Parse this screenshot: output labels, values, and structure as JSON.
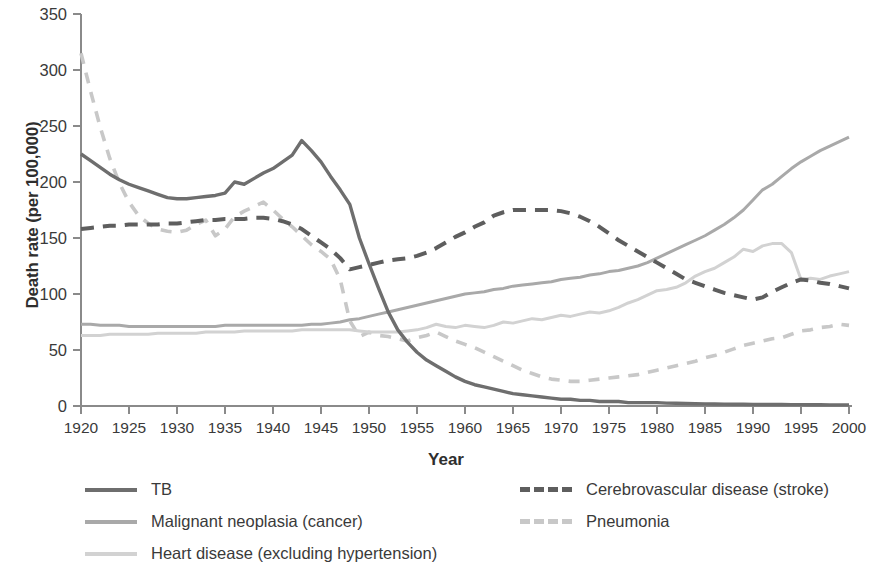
{
  "chart_data": {
    "type": "line",
    "title": "",
    "xlabel": "Year",
    "ylabel": "Death rate (per 100,000)",
    "xlim": [
      1920,
      2000
    ],
    "ylim": [
      0,
      350
    ],
    "ytick_step": 50,
    "xtick_step": 5,
    "grid": false,
    "legend_position": "bottom",
    "xticks": [
      "1920",
      "1925",
      "1930",
      "1935",
      "1940",
      "1945",
      "1950",
      "1955",
      "1960",
      "1965",
      "1970",
      "1975",
      "1980",
      "1985",
      "1990",
      "1995",
      "2000"
    ],
    "yticks": [
      "0",
      "50",
      "100",
      "150",
      "200",
      "250",
      "300",
      "350"
    ],
    "x": [
      1920,
      1921,
      1922,
      1923,
      1924,
      1925,
      1926,
      1927,
      1928,
      1929,
      1930,
      1931,
      1932,
      1933,
      1934,
      1935,
      1936,
      1937,
      1938,
      1939,
      1940,
      1941,
      1942,
      1943,
      1944,
      1945,
      1946,
      1947,
      1948,
      1949,
      1950,
      1951,
      1952,
      1953,
      1954,
      1955,
      1956,
      1957,
      1958,
      1959,
      1960,
      1961,
      1962,
      1963,
      1964,
      1965,
      1966,
      1967,
      1968,
      1969,
      1970,
      1971,
      1972,
      1973,
      1974,
      1975,
      1976,
      1977,
      1978,
      1979,
      1980,
      1981,
      1982,
      1983,
      1984,
      1985,
      1986,
      1987,
      1988,
      1989,
      1990,
      1991,
      1992,
      1993,
      1994,
      1995,
      1996,
      1997,
      1998,
      1999,
      2000
    ],
    "series": [
      {
        "name": "TB",
        "style": "solid",
        "color": "#6e6e6e",
        "width": 3.4,
        "values": [
          225,
          219,
          213,
          207,
          202,
          198,
          195,
          192,
          189,
          186,
          185,
          185,
          186,
          187,
          188,
          190,
          200,
          198,
          203,
          208,
          212,
          218,
          224,
          237,
          228,
          218,
          205,
          193,
          180,
          150,
          127,
          105,
          84,
          68,
          57,
          48,
          41,
          36,
          31,
          26,
          22,
          19,
          17,
          15,
          13,
          11,
          10,
          9,
          8,
          7,
          6,
          6,
          5,
          5,
          4,
          4,
          4,
          3,
          3,
          3,
          3,
          2.6,
          2.4,
          2.2,
          2,
          1.9,
          1.8,
          1.7,
          1.6,
          1.5,
          1.4,
          1.4,
          1.3,
          1.3,
          1.2,
          1.2,
          1.1,
          1.1,
          1,
          1,
          1
        ]
      },
      {
        "name": "Malignant neoplasia (cancer)",
        "style": "solid",
        "color": "#a9a9a9",
        "width": 3.0,
        "values": [
          73,
          73,
          72,
          72,
          72,
          71,
          71,
          71,
          71,
          71,
          71,
          71,
          71,
          71,
          71,
          72,
          72,
          72,
          72,
          72,
          72,
          72,
          72,
          72,
          73,
          73,
          74,
          75,
          77,
          78,
          80,
          82,
          84,
          86,
          88,
          90,
          92,
          94,
          96,
          98,
          100,
          101,
          102,
          104,
          105,
          107,
          108,
          109,
          110,
          111,
          113,
          114,
          115,
          117,
          118,
          120,
          121,
          123,
          125,
          128,
          132,
          136,
          140,
          144,
          148,
          152,
          157,
          162,
          168,
          175,
          184,
          193,
          198,
          205,
          212,
          218,
          223,
          228,
          232,
          236,
          240
        ]
      },
      {
        "name": "Heart disease (excluding hypertension)",
        "style": "solid",
        "color": "#d2d2d2",
        "width": 3.0,
        "values": [
          63,
          63,
          63,
          64,
          64,
          64,
          64,
          64,
          65,
          65,
          65,
          65,
          65,
          66,
          66,
          66,
          66,
          67,
          67,
          67,
          67,
          67,
          67,
          68,
          68,
          68,
          68,
          68,
          68,
          67,
          66,
          66,
          66,
          66,
          67,
          68,
          70,
          73,
          71,
          70,
          72,
          71,
          70,
          72,
          75,
          74,
          76,
          78,
          77,
          79,
          81,
          80,
          82,
          84,
          83,
          85,
          88,
          92,
          95,
          99,
          103,
          104,
          106,
          110,
          116,
          120,
          123,
          128,
          133,
          140,
          138,
          143,
          145,
          145,
          137,
          113,
          114,
          113,
          116,
          118,
          120
        ]
      },
      {
        "name": "Cerebrovascular disease (stroke)",
        "style": "dashed-dark",
        "color": "#5e5e5e",
        "width": 4.0,
        "values": [
          158,
          159,
          160,
          161,
          161,
          162,
          162,
          162,
          162,
          163,
          163,
          164,
          165,
          166,
          166,
          167,
          167,
          167,
          168,
          168,
          167,
          165,
          162,
          158,
          152,
          146,
          140,
          132,
          122,
          124,
          126,
          128,
          130,
          131,
          132,
          134,
          137,
          141,
          146,
          151,
          155,
          160,
          164,
          170,
          173,
          175,
          175,
          175,
          175,
          175,
          174,
          172,
          169,
          165,
          160,
          154,
          148,
          143,
          138,
          133,
          128,
          123,
          118,
          113,
          110,
          107,
          104,
          101,
          99,
          97,
          95,
          97,
          102,
          106,
          110,
          113,
          112,
          110,
          109,
          107,
          105
        ]
      },
      {
        "name": "Pneumonia",
        "style": "dashed-light",
        "color": "#c8c8c8",
        "width": 3.6,
        "values": [
          315,
          281,
          249,
          221,
          199,
          182,
          170,
          163,
          158,
          156,
          155,
          157,
          162,
          166,
          152,
          158,
          169,
          174,
          178,
          182,
          175,
          167,
          160,
          152,
          144,
          138,
          131,
          113,
          76,
          62,
          66,
          63,
          62,
          60,
          58,
          61,
          63,
          66,
          62,
          58,
          55,
          52,
          48,
          44,
          40,
          36,
          32,
          29,
          26,
          24,
          23,
          22,
          22,
          23,
          24,
          25,
          26,
          27,
          28,
          30,
          32,
          34,
          36,
          38,
          40,
          43,
          45,
          48,
          51,
          54,
          56,
          58,
          60,
          61,
          64,
          67,
          68,
          70,
          71,
          73,
          72
        ]
      }
    ]
  },
  "legend": {
    "items": [
      {
        "label": "TB",
        "swatch_color": "#6e6e6e",
        "dash": "none"
      },
      {
        "label": "Malignant neoplasia (cancer)",
        "swatch_color": "#a9a9a9",
        "dash": "none"
      },
      {
        "label": "Heart disease (excluding hypertension)",
        "swatch_color": "#d2d2d2",
        "dash": "none"
      },
      {
        "label": "Cerebrovascular disease (stroke)",
        "swatch_color": "#5e5e5e",
        "dash": "dashed"
      },
      {
        "label": "Pneumonia",
        "swatch_color": "#c8c8c8",
        "dash": "dashed"
      }
    ]
  },
  "axis": {
    "color": "#8a8a8a"
  }
}
